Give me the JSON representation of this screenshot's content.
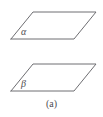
{
  "figure": {
    "caption": "(a)",
    "background_color": "#ffffff",
    "stroke_color": "#6e6e72",
    "label_color": "#4d4d51",
    "planes": [
      {
        "id": "alpha",
        "label": "α",
        "label_name": "alpha",
        "outline_points": "11,39 33,12 96,12 74,39 11,39",
        "position": "upper"
      },
      {
        "id": "beta",
        "label": "β",
        "label_name": "beta",
        "outline_points": "11,91 33,64 96,64 74,91 11,91",
        "position": "lower"
      }
    ]
  }
}
